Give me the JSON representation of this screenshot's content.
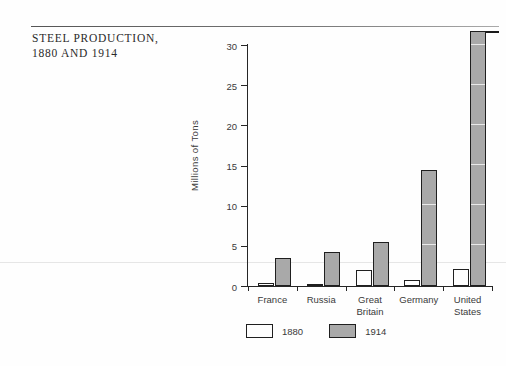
{
  "caption": {
    "line1": "STEEL PRODUCTION,",
    "line2": "1880 AND 1914"
  },
  "chart_data": {
    "type": "bar",
    "title": "STEEL PRODUCTION, 1880 AND 1914",
    "xlabel": "",
    "ylabel": "Millions of Tons",
    "ylim": [
      0,
      30
    ],
    "yticks": [
      0,
      5,
      10,
      15,
      20,
      25,
      30
    ],
    "ytick_labels": [
      "0",
      "5",
      "10",
      "15",
      "20",
      "25",
      "30"
    ],
    "grid": false,
    "legend_position": "below-left",
    "categories": [
      "France",
      "Russia",
      "Great\nBritain",
      "Germany",
      "United\nStates"
    ],
    "series": [
      {
        "name": "1880",
        "color": "#fdfdfd",
        "values": [
          0.4,
          0.3,
          2.0,
          0.7,
          2.1
        ]
      },
      {
        "name": "1914",
        "color": "#a9a9a9",
        "values": [
          3.5,
          4.2,
          5.5,
          14.5,
          31.8
        ]
      }
    ]
  }
}
